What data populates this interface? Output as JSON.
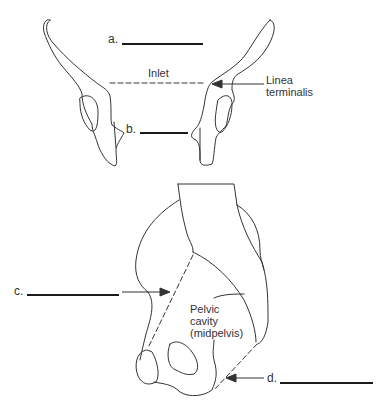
{
  "diagram": {
    "type": "anatomy-worksheet",
    "colors": {
      "stroke": "#333333",
      "text": "#333333",
      "answer_line": "#1a1a1a",
      "background": "#ffffff"
    },
    "top_view": {
      "labels": {
        "a": "a.",
        "b": "b.",
        "inlet": "Inlet",
        "linea_terminalis_line1": "Linea",
        "linea_terminalis_line2": "terminalis"
      }
    },
    "side_view": {
      "labels": {
        "c": "c.",
        "d": "d.",
        "pelvic_cavity_line1": "Pelvic",
        "pelvic_cavity_line2": "cavity",
        "pelvic_cavity_line3": "(midpelvis)"
      }
    }
  }
}
